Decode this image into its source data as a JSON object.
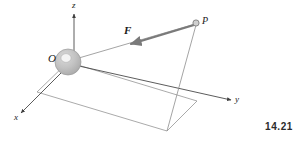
{
  "figure": {
    "number": "14.21",
    "caption_text": "14.21",
    "background_color": "#ffffff",
    "line_color": "#5a5a5a",
    "axis_color": "#4a4a4a",
    "vector_color": "#6e6e6e",
    "sphere_fill": "#bdbdbd",
    "sphere_stroke": "#8f8f8f",
    "sphere_hole_fill": "#f2f2f2",
    "label_color": "#1a1a1a"
  },
  "axes": [
    {
      "id": "z",
      "label": "z",
      "direction": "up",
      "arrow": true
    },
    {
      "id": "y",
      "label": "y",
      "direction": "right",
      "arrow": true
    },
    {
      "id": "x",
      "label": "x",
      "direction": "down-left",
      "arrow": true
    }
  ],
  "points": [
    {
      "id": "O",
      "label": "O",
      "kind": "origin-sphere",
      "x": 68,
      "y": 62
    },
    {
      "id": "P",
      "label": "P",
      "kind": "point-marker",
      "x": 196,
      "y": 23
    }
  ],
  "vectors": [
    {
      "id": "F",
      "label": "F",
      "style": "bold-italic",
      "from": "P",
      "to": "O",
      "arrowhead_at": "toward-origin",
      "description": "force vector acting along line from P toward O"
    }
  ],
  "construction_lines": [
    {
      "id": "line-O-P",
      "description": "line from origin O to point P"
    },
    {
      "id": "vertical-drop",
      "description": "vertical line from P down to its projection in the xy-plane"
    },
    {
      "id": "base-parallelogram",
      "description": "parallelogram in the xy-plane showing the projection of P"
    }
  ],
  "icons": {
    "sphere": "origin-sphere-icon",
    "point": "point-marker-icon",
    "arrowhead": "arrowhead-icon"
  }
}
